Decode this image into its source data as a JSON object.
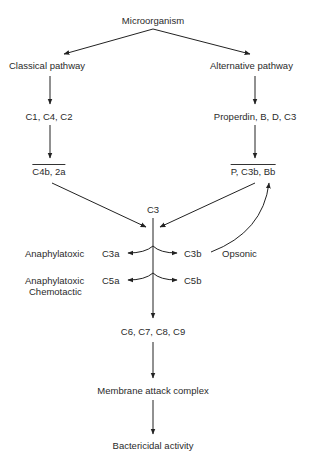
{
  "diagram": {
    "nodes": {
      "microorganism": "Microorganism",
      "classical": "Classical pathway",
      "alternative": "Alternative pathway",
      "c1c4c2": "C1, C4, C2",
      "properdin": "Properdin, B, D, C3",
      "c4b2a": "C4b, 2a",
      "pc3bbb": "P, C3b, Bb",
      "c3": "C3",
      "c3a": "C3a",
      "c3b": "C3b",
      "c5a": "C5a",
      "c5b": "C5b",
      "c6to9": "C6, C7, C8, C9",
      "mac": "Membrane attack complex",
      "bactericidal": "Bactericidal activity"
    },
    "annotations": {
      "c3a_role": "Anaphylatoxic",
      "c3b_role": "Opsonic",
      "c5a_role_1": "Anaphylatoxic",
      "c5a_role_2": "Chemotactic"
    }
  }
}
